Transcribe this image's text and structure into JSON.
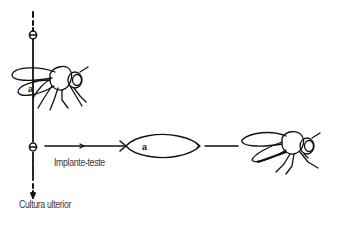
{
  "diagram": {
    "type": "flow",
    "labels": {
      "implant_test": "Implante-teste",
      "further_culture": "Cultura ulterior"
    },
    "nodes": [
      {
        "id": "fly-host",
        "kind": "adult fly with implant",
        "marker": "a"
      },
      {
        "id": "generation-marker-top",
        "kind": "circle marker"
      },
      {
        "id": "generation-marker-mid",
        "kind": "circle marker"
      },
      {
        "id": "larva-test",
        "kind": "larva with implant",
        "marker": "a"
      },
      {
        "id": "fly-result",
        "kind": "adult fly"
      }
    ],
    "edges": [
      {
        "from": "generation-marker-mid",
        "to": "larva-test",
        "label": "Implante-teste"
      },
      {
        "from": "larva-test",
        "to": "fly-result"
      },
      {
        "from": "generation-marker-mid",
        "to": "further-culture",
        "label": "Cultura ulterior"
      }
    ],
    "colors": {
      "ink": "#111111",
      "text": "#3a3a3a",
      "background": "#ffffff"
    }
  }
}
